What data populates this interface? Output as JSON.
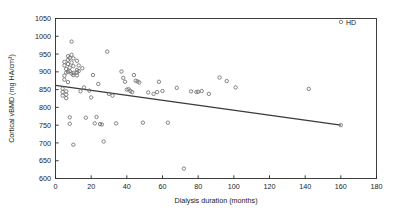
{
  "figure": {
    "background": "#ffffff",
    "width": 397,
    "height": 212
  },
  "chart_data": {
    "type": "scatter",
    "title": "",
    "xlabel": "Dialysis duration (months)",
    "ylabel": "Cortical vBMD (mg HA/cm³)",
    "xlim": [
      0,
      180
    ],
    "ylim": [
      600,
      1050
    ],
    "xticks": [
      0,
      20,
      40,
      60,
      80,
      100,
      120,
      140,
      160,
      180
    ],
    "yticks": [
      600,
      650,
      700,
      750,
      800,
      850,
      900,
      950,
      1000,
      1050
    ],
    "grid": false,
    "legend": {
      "position": "top-right",
      "entries": [
        {
          "name": "HD",
          "marker": "open-circle",
          "color": "#6f6f6f"
        }
      ]
    },
    "marker": {
      "style": "open-circle",
      "edge_color": "#6f6f6f",
      "fill": "none",
      "size_px": 3.4
    },
    "series": [
      {
        "name": "HD",
        "points": [
          [
            4,
            853
          ],
          [
            4,
            843
          ],
          [
            4,
            833
          ],
          [
            5,
            889
          ],
          [
            5,
            878
          ],
          [
            5,
            928
          ],
          [
            5,
            918
          ],
          [
            6,
            908
          ],
          [
            6,
            898
          ],
          [
            6,
            845
          ],
          [
            6,
            836
          ],
          [
            6,
            826
          ],
          [
            7,
            944
          ],
          [
            7,
            934
          ],
          [
            7,
            922
          ],
          [
            7,
            900
          ],
          [
            7,
            871
          ],
          [
            8,
            939
          ],
          [
            8,
            912
          ],
          [
            8,
            902
          ],
          [
            8,
            772
          ],
          [
            8,
            754
          ],
          [
            9,
            985
          ],
          [
            9,
            948
          ],
          [
            9,
            926
          ],
          [
            9,
            895
          ],
          [
            10,
            938
          ],
          [
            10,
            916
          ],
          [
            10,
            897
          ],
          [
            10,
            891
          ],
          [
            10,
            695
          ],
          [
            12,
            931
          ],
          [
            12,
            905
          ],
          [
            12,
            898
          ],
          [
            12,
            890
          ],
          [
            13,
            918
          ],
          [
            13,
            902
          ],
          [
            14,
            845
          ],
          [
            15,
            910
          ],
          [
            16,
            856
          ],
          [
            17,
            771
          ],
          [
            19,
            847
          ],
          [
            20,
            828
          ],
          [
            21,
            891
          ],
          [
            22,
            755
          ],
          [
            23,
            773
          ],
          [
            24,
            866
          ],
          [
            25,
            753
          ],
          [
            26,
            752
          ],
          [
            27,
            704
          ],
          [
            29,
            957
          ],
          [
            30,
            838
          ],
          [
            32,
            833
          ],
          [
            34,
            755
          ],
          [
            37,
            901
          ],
          [
            38,
            883
          ],
          [
            39,
            872
          ],
          [
            40,
            850
          ],
          [
            41,
            851
          ],
          [
            42,
            846
          ],
          [
            43,
            843
          ],
          [
            44,
            891
          ],
          [
            45,
            875
          ],
          [
            46,
            873
          ],
          [
            47,
            870
          ],
          [
            49,
            757
          ],
          [
            52,
            842
          ],
          [
            55,
            838
          ],
          [
            57,
            843
          ],
          [
            58,
            872
          ],
          [
            60,
            846
          ],
          [
            63,
            757
          ],
          [
            68,
            855
          ],
          [
            72,
            628
          ],
          [
            76,
            845
          ],
          [
            79,
            843
          ],
          [
            80,
            844
          ],
          [
            82,
            846
          ],
          [
            86,
            838
          ],
          [
            92,
            884
          ],
          [
            96,
            874
          ],
          [
            101,
            856
          ],
          [
            142,
            852
          ],
          [
            160,
            750
          ]
        ]
      }
    ],
    "trendline": {
      "type": "linear",
      "x_start": 0,
      "y_start": 862,
      "x_end": 160,
      "y_end": 750,
      "color": "#3a3a3a",
      "width_px": 1.1
    }
  }
}
